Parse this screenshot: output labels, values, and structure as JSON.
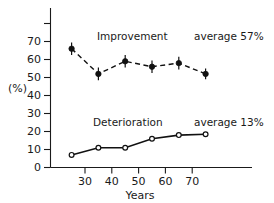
{
  "chart_data": {
    "type": "line",
    "title": "",
    "xlabel": "Years",
    "ylabel": "(%)",
    "xlim": [
      20,
      80
    ],
    "ylim": [
      0,
      80
    ],
    "grid": false,
    "legend_position": "inline-annotations",
    "x_ticks": [
      30,
      40,
      50,
      60,
      70
    ],
    "x_tick_labels": [
      "30",
      "40",
      "50",
      "60",
      "70"
    ],
    "y_ticks": [
      0,
      10,
      20,
      30,
      40,
      50,
      60,
      70,
      80
    ],
    "y_tick_labels": [
      "0",
      "10",
      "20",
      "30",
      "40",
      "50",
      "60",
      "70",
      ""
    ],
    "x": [
      25,
      35,
      45,
      55,
      65,
      75
    ],
    "series": [
      {
        "name": "Improvement",
        "values": [
          66,
          52,
          59,
          56,
          58,
          52
        ],
        "errors": [
          3.5,
          3.5,
          3.5,
          3.5,
          3.5,
          3.0
        ],
        "marker": "filled-circle",
        "linestyle": "dashed",
        "average_label": "average 57%",
        "average": 57
      },
      {
        "name": "Deterioration",
        "values": [
          7,
          11,
          11,
          16,
          18,
          18.5
        ],
        "marker": "open-circle",
        "linestyle": "solid",
        "average_label": "average 13%",
        "average": 13
      }
    ],
    "annotations": [
      {
        "text": "Improvement",
        "x": 47,
        "y": 71
      },
      {
        "text": "average 57%",
        "x": 74,
        "y": 71
      },
      {
        "text": "Deterioration",
        "x": 45,
        "y": 27
      },
      {
        "text": "average 13%",
        "x": 74,
        "y": 27
      }
    ],
    "colors": {
      "axis": "#1a1a1a",
      "series1": "#111111",
      "series2": "#111111",
      "background": "#ffffff"
    }
  },
  "labels": {
    "y_axis_title": "(%)",
    "x_axis_title": "Years",
    "improvement": "Improvement",
    "deterioration": "Deterioration",
    "improvement_average": "average 57%",
    "deterioration_average": "average 13%",
    "y0": "0",
    "y10": "10",
    "y20": "20",
    "y30": "30",
    "y40": "40",
    "y50": "50",
    "y60": "60",
    "y70": "70",
    "x30": "30",
    "x40": "40",
    "x50": "50",
    "x60": "60",
    "x70": "70"
  }
}
